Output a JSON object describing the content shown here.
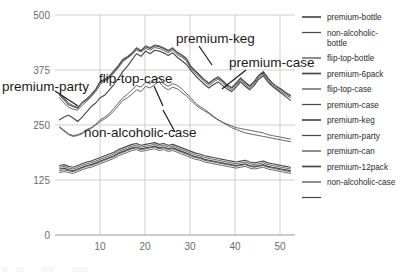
{
  "chart_data": {
    "type": "line",
    "title": "",
    "xlabel": "",
    "ylabel": "",
    "xlim": [
      0,
      53
    ],
    "ylim": [
      0,
      500
    ],
    "yticks": [
      0,
      125,
      250,
      375,
      500
    ],
    "xticks": [
      10,
      20,
      30,
      40,
      50
    ],
    "grid": true,
    "legend_position": "right",
    "line_color": "#4a4a4a",
    "grid_color": "#c8c8c8",
    "axis_color": "#9a9a9a",
    "x": [
      1,
      2,
      3,
      4,
      5,
      6,
      7,
      8,
      9,
      10,
      11,
      12,
      13,
      14,
      15,
      16,
      17,
      18,
      19,
      20,
      21,
      22,
      23,
      24,
      25,
      26,
      27,
      28,
      29,
      30,
      31,
      32,
      33,
      34,
      35,
      36,
      37,
      38,
      39,
      40,
      41,
      42,
      43,
      44,
      45,
      46,
      47,
      48,
      49,
      50,
      51,
      52
    ],
    "series": [
      {
        "name": "premium-bottle",
        "values": [
          318,
          308,
          296,
          292,
          288,
          300,
          308,
          318,
          330,
          348,
          352,
          360,
          372,
          384,
          398,
          404,
          412,
          424,
          418,
          428,
          424,
          430,
          428,
          424,
          418,
          424,
          414,
          408,
          400,
          382,
          372,
          362,
          352,
          344,
          352,
          358,
          350,
          340,
          334,
          344,
          356,
          346,
          338,
          348,
          362,
          370,
          356,
          344,
          336,
          330,
          322,
          316
        ]
      },
      {
        "name": "non-alcoholic-bottle",
        "values": [
          312,
          300,
          290,
          286,
          284,
          294,
          304,
          314,
          326,
          342,
          350,
          356,
          368,
          380,
          394,
          402,
          410,
          420,
          416,
          424,
          420,
          426,
          424,
          420,
          414,
          420,
          410,
          404,
          396,
          378,
          368,
          358,
          348,
          340,
          348,
          354,
          346,
          336,
          330,
          340,
          352,
          342,
          334,
          344,
          358,
          366,
          352,
          340,
          332,
          326,
          318,
          312
        ]
      },
      {
        "name": "flip-top-bottle",
        "values": [
          322,
          312,
          300,
          294,
          290,
          302,
          310,
          320,
          332,
          350,
          354,
          362,
          374,
          386,
          400,
          406,
          414,
          426,
          420,
          430,
          426,
          432,
          430,
          426,
          420,
          426,
          416,
          410,
          402,
          384,
          374,
          364,
          354,
          346,
          354,
          360,
          352,
          342,
          336,
          346,
          358,
          348,
          340,
          350,
          364,
          372,
          358,
          346,
          338,
          332,
          324,
          318
        ]
      },
      {
        "name": "premium-6pack",
        "values": [
          262,
          268,
          272,
          266,
          258,
          268,
          280,
          292,
          300,
          312,
          318,
          330,
          342,
          356,
          372,
          384,
          398,
          412,
          406,
          418,
          412,
          420,
          418,
          414,
          408,
          414,
          404,
          396,
          388,
          374,
          362,
          352,
          342,
          334,
          342,
          348,
          340,
          332,
          326,
          336,
          348,
          338,
          330,
          340,
          354,
          362,
          348,
          338,
          330,
          322,
          314,
          306
        ]
      },
      {
        "name": "flip-top-case",
        "values": [
          246,
          238,
          230,
          226,
          228,
          232,
          240,
          244,
          252,
          262,
          268,
          276,
          288,
          300,
          312,
          320,
          330,
          340,
          336,
          348,
          344,
          352,
          358,
          344,
          338,
          344,
          340,
          332,
          322,
          312,
          300,
          292,
          286,
          278,
          270,
          262,
          256,
          250,
          244,
          240,
          236,
          232,
          230,
          228,
          226,
          224,
          222,
          220,
          218,
          216,
          214,
          212
        ]
      },
      {
        "name": "premium-case",
        "values": [
          244,
          236,
          228,
          224,
          226,
          230,
          238,
          242,
          250,
          258,
          264,
          272,
          282,
          294,
          306,
          312,
          320,
          330,
          326,
          338,
          334,
          342,
          348,
          336,
          330,
          336,
          332,
          324,
          316,
          306,
          296,
          288,
          282,
          276,
          268,
          262,
          256,
          252,
          248,
          244,
          242,
          240,
          238,
          236,
          234,
          232,
          228,
          226,
          224,
          222,
          220,
          218
        ]
      },
      {
        "name": "premium-keg",
        "values": [
          150,
          152,
          148,
          146,
          150,
          154,
          158,
          160,
          164,
          168,
          172,
          176,
          180,
          186,
          190,
          194,
          198,
          200,
          196,
          198,
          200,
          202,
          198,
          200,
          196,
          198,
          194,
          190,
          186,
          182,
          178,
          176,
          172,
          170,
          168,
          166,
          164,
          162,
          160,
          158,
          160,
          162,
          158,
          156,
          158,
          160,
          156,
          154,
          152,
          150,
          148,
          146
        ]
      },
      {
        "name": "premium-party",
        "values": [
          146,
          148,
          146,
          144,
          148,
          152,
          156,
          158,
          162,
          166,
          170,
          174,
          178,
          184,
          188,
          192,
          196,
          198,
          194,
          196,
          198,
          200,
          196,
          198,
          194,
          196,
          192,
          188,
          184,
          180,
          176,
          174,
          170,
          168,
          166,
          164,
          162,
          160,
          158,
          156,
          158,
          160,
          156,
          154,
          156,
          158,
          154,
          152,
          150,
          148,
          146,
          144
        ]
      },
      {
        "name": "premium-can",
        "values": [
          154,
          156,
          152,
          150,
          154,
          158,
          162,
          164,
          168,
          172,
          176,
          180,
          184,
          190,
          194,
          198,
          202,
          204,
          200,
          202,
          204,
          206,
          202,
          204,
          200,
          202,
          198,
          194,
          190,
          186,
          182,
          180,
          176,
          174,
          172,
          170,
          168,
          166,
          164,
          162,
          164,
          166,
          162,
          160,
          162,
          164,
          160,
          158,
          156,
          154,
          152,
          150
        ]
      },
      {
        "name": "premium-12pack",
        "values": [
          158,
          160,
          156,
          154,
          158,
          162,
          166,
          168,
          172,
          176,
          180,
          184,
          188,
          194,
          198,
          202,
          206,
          208,
          204,
          206,
          208,
          210,
          206,
          208,
          204,
          206,
          202,
          198,
          194,
          190,
          186,
          184,
          180,
          178,
          176,
          174,
          172,
          170,
          168,
          166,
          168,
          170,
          166,
          164,
          166,
          168,
          164,
          162,
          160,
          158,
          156,
          154
        ]
      },
      {
        "name": "non-alcoholic-case",
        "values": [
          142,
          144,
          142,
          140,
          144,
          148,
          152,
          154,
          158,
          162,
          166,
          170,
          174,
          180,
          184,
          188,
          192,
          194,
          190,
          192,
          194,
          196,
          192,
          194,
          190,
          192,
          188,
          184,
          180,
          176,
          172,
          170,
          166,
          164,
          162,
          160,
          158,
          156,
          154,
          152,
          154,
          156,
          152,
          150,
          152,
          154,
          150,
          148,
          146,
          144,
          142,
          140
        ]
      }
    ],
    "annotations": [
      {
        "label": "premium-party"
      },
      {
        "label": "flip-top-case"
      },
      {
        "label": "non-alcoholic-case"
      },
      {
        "label": "premium-keg"
      },
      {
        "label": "premium-case"
      }
    ]
  },
  "legend": {
    "items": [
      {
        "label": "premium-bottle"
      },
      {
        "label": "non-alcoholic-",
        "label2": "bottle"
      },
      {
        "label": "flip-top-bottle"
      },
      {
        "label": "premium-6pack"
      },
      {
        "label": "flip-top-case"
      },
      {
        "label": "premium-case"
      },
      {
        "label": "premium-keg"
      },
      {
        "label": "premium-party"
      },
      {
        "label": "premium-can"
      },
      {
        "label": "premium-12pack"
      },
      {
        "label": "non-alcoholic-case"
      },
      {
        "label": ""
      }
    ]
  },
  "axes": {
    "y_labels": [
      "500",
      "375",
      "250",
      "125",
      "0"
    ],
    "x_labels": [
      "10",
      "20",
      "30",
      "40",
      "50"
    ]
  }
}
